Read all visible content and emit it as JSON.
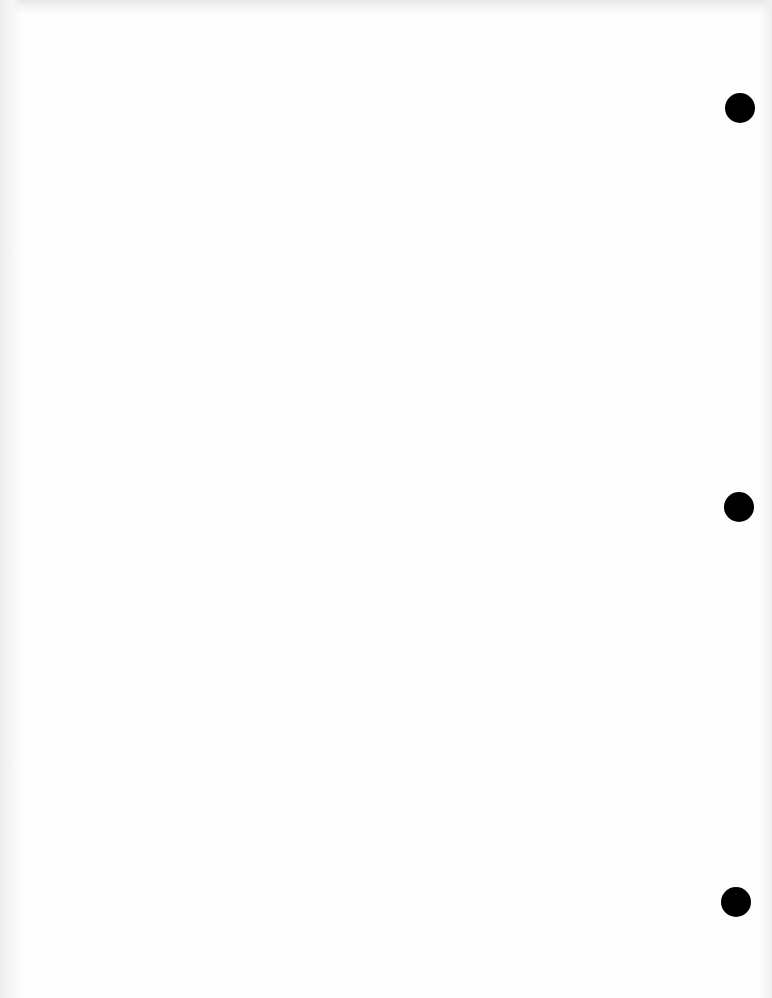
{
  "page": {
    "background_color": "#fefefe",
    "width": 772,
    "height": 998
  },
  "punch_holes": [
    {
      "cx": 740,
      "cy": 108,
      "r": 15,
      "color": "#000000"
    },
    {
      "cx": 739,
      "cy": 507,
      "r": 15,
      "color": "#000000"
    },
    {
      "cx": 736,
      "cy": 902,
      "r": 15,
      "color": "#000000"
    }
  ]
}
